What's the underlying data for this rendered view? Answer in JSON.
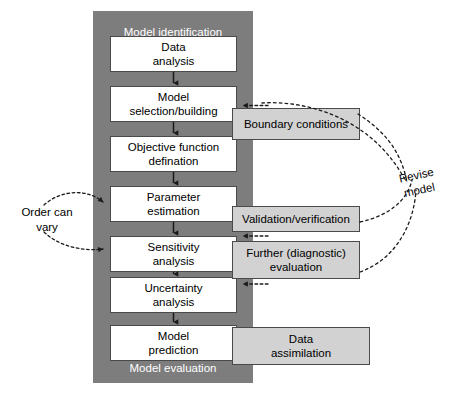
{
  "diagram": {
    "title_top": "Model identification",
    "title_bottom": "Model evaluation",
    "colors": {
      "container_gray": "#7d7d7d",
      "side_box_gray": "#d2d2d2",
      "process_box": "#ffffff",
      "stroke": "#4a4a4a",
      "container_label_text": "#ffffff",
      "body_text": "#000000"
    },
    "process_steps": [
      {
        "line1": "Data",
        "line2": "analysis"
      },
      {
        "line1": "Model",
        "line2": "selection/building"
      },
      {
        "line1": "Objective function",
        "line2": "defination"
      },
      {
        "line1": "Parameter",
        "line2": "estimation"
      },
      {
        "line1": "Sensitivity",
        "line2": "analysis"
      },
      {
        "line1": "Uncertainty",
        "line2": "analysis"
      },
      {
        "line1": "Model",
        "line2": "prediction"
      }
    ],
    "side_boxes": [
      {
        "line1": "Boundary conditions",
        "line2": ""
      },
      {
        "line1": "Validation/verification",
        "line2": ""
      },
      {
        "line1": "Further (diagnostic)",
        "line2": "evaluation"
      },
      {
        "line1": "Data",
        "line2": "assimilation"
      }
    ],
    "annotations": [
      {
        "line1": "Order can",
        "line2": "vary"
      },
      {
        "line1": "Revise",
        "line2": "model"
      }
    ]
  }
}
